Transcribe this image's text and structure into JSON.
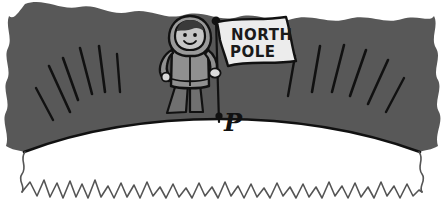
{
  "illustration": {
    "title": "North Pole figure on curved earth surface",
    "flag": {
      "line1": "NORTH",
      "line2": "POLE"
    },
    "labels": {
      "point_p": "P"
    },
    "colors": {
      "landmass_gray": "#585858",
      "parka_gray": "#909090",
      "parka_shadow": "#7d7d7d",
      "skin_gray": "#b8b8b8",
      "hair_dark": "#3a3a3a",
      "flag_fill": "#ececec",
      "ice_white": "#ffffff",
      "outline_black": "#111111",
      "wave_line": "#555555"
    },
    "figure": {
      "hood": "hood-shape",
      "face": "smiling-face",
      "eyes": 2,
      "arms": 2,
      "legs": 2
    },
    "counts": {
      "hatch_lines_left": 6,
      "hatch_lines_right": 6,
      "ice_wave_peaks": 28
    }
  }
}
